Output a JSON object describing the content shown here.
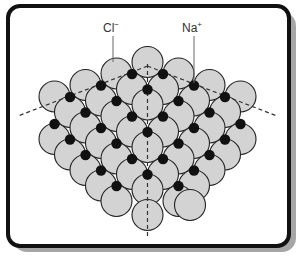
{
  "figure": {
    "labels": [
      {
        "text": "Cl",
        "charge": "−",
        "x": 103,
        "y": 20,
        "leader": [
          113,
          36,
          113,
          62
        ]
      },
      {
        "text": "Na",
        "charge": "+",
        "x": 182,
        "y": 20,
        "leader": [
          194,
          36,
          194,
          83
        ]
      }
    ],
    "colors": {
      "chloride": "#d3d3d3",
      "sodium": "#111111",
      "outline": "#222222",
      "dashed": "#333333",
      "frame": "#111111",
      "shadow": "#a6a6a6"
    },
    "ion_radius": {
      "chloride": 15.5,
      "sodium": 5.2
    },
    "dashed_lines": [
      [
        147.5,
        64,
        147.5,
        236
      ],
      [
        147.5,
        66,
        18,
        116
      ],
      [
        147.5,
        66,
        277,
        116
      ]
    ],
    "chloride_ions": [
      [
        147.5,
        62
      ],
      [
        116.5,
        73.5
      ],
      [
        178.5,
        73.5
      ],
      [
        85.5,
        85
      ],
      [
        132,
        89
      ],
      [
        163,
        89
      ],
      [
        209.5,
        85
      ],
      [
        54.5,
        96.5
      ],
      [
        101,
        100.5
      ],
      [
        147.5,
        104.5
      ],
      [
        194,
        100.5
      ],
      [
        240.5,
        96.5
      ],
      [
        70,
        112
      ],
      [
        116.5,
        116
      ],
      [
        178.5,
        116
      ],
      [
        225,
        112
      ],
      [
        85.5,
        127.5
      ],
      [
        132,
        131.5
      ],
      [
        163,
        131.5
      ],
      [
        209.5,
        127.5
      ],
      [
        54.5,
        139
      ],
      [
        101,
        143
      ],
      [
        147.5,
        147
      ],
      [
        194,
        143
      ],
      [
        240.5,
        139
      ],
      [
        70,
        154.5
      ],
      [
        116.5,
        158.5
      ],
      [
        178.5,
        158.5
      ],
      [
        225,
        154.5
      ],
      [
        85.5,
        170
      ],
      [
        132,
        174
      ],
      [
        163,
        174
      ],
      [
        209.5,
        170
      ],
      [
        101,
        185.5
      ],
      [
        147.5,
        189.5
      ],
      [
        194,
        185.5
      ],
      [
        116.5,
        201
      ],
      [
        178.5,
        201
      ],
      [
        147.5,
        215
      ],
      [
        190,
        205
      ]
    ],
    "sodium_ions": [
      [
        132,
        74
      ],
      [
        163,
        74
      ],
      [
        101,
        85.5
      ],
      [
        194,
        85.5
      ],
      [
        147.5,
        89.5
      ],
      [
        70,
        97
      ],
      [
        225,
        97
      ],
      [
        116.5,
        101
      ],
      [
        178.5,
        101
      ],
      [
        85.5,
        112.5
      ],
      [
        209.5,
        112.5
      ],
      [
        132,
        116.5
      ],
      [
        163,
        116.5
      ],
      [
        54.5,
        124
      ],
      [
        240.5,
        124
      ],
      [
        101,
        128
      ],
      [
        194,
        128
      ],
      [
        147.5,
        132
      ],
      [
        70,
        139.5
      ],
      [
        225,
        139.5
      ],
      [
        116.5,
        143.5
      ],
      [
        178.5,
        143.5
      ],
      [
        85.5,
        155
      ],
      [
        209.5,
        155
      ],
      [
        132,
        159
      ],
      [
        163,
        159
      ],
      [
        101,
        170.5
      ],
      [
        194,
        170.5
      ],
      [
        147.5,
        174.5
      ],
      [
        116.5,
        186
      ],
      [
        178.5,
        186
      ]
    ]
  }
}
